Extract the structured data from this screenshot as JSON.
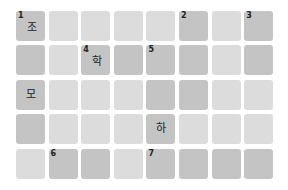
{
  "puzzle": {
    "type": "crossword",
    "rows": 5,
    "cols": 8,
    "colors": {
      "dark": "#c4c4c4",
      "light": "#dcdcdc"
    },
    "cells": [
      [
        {
          "shade": "dark",
          "num": "1",
          "ch": "조"
        },
        {
          "shade": "light",
          "num": "",
          "ch": ""
        },
        {
          "shade": "light",
          "num": "",
          "ch": ""
        },
        {
          "shade": "light",
          "num": "",
          "ch": ""
        },
        {
          "shade": "light",
          "num": "",
          "ch": ""
        },
        {
          "shade": "dark",
          "num": "2",
          "ch": ""
        },
        {
          "shade": "light",
          "num": "",
          "ch": ""
        },
        {
          "shade": "dark",
          "num": "3",
          "ch": ""
        }
      ],
      [
        {
          "shade": "dark",
          "num": "",
          "ch": ""
        },
        {
          "shade": "light",
          "num": "",
          "ch": ""
        },
        {
          "shade": "dark",
          "num": "4",
          "ch": "학"
        },
        {
          "shade": "dark",
          "num": "",
          "ch": ""
        },
        {
          "shade": "dark",
          "num": "5",
          "ch": ""
        },
        {
          "shade": "dark",
          "num": "",
          "ch": ""
        },
        {
          "shade": "light",
          "num": "",
          "ch": ""
        },
        {
          "shade": "dark",
          "num": "",
          "ch": ""
        }
      ],
      [
        {
          "shade": "dark",
          "num": "",
          "ch": "모"
        },
        {
          "shade": "light",
          "num": "",
          "ch": ""
        },
        {
          "shade": "light",
          "num": "",
          "ch": ""
        },
        {
          "shade": "light",
          "num": "",
          "ch": ""
        },
        {
          "shade": "dark",
          "num": "",
          "ch": ""
        },
        {
          "shade": "dark",
          "num": "",
          "ch": ""
        },
        {
          "shade": "light",
          "num": "",
          "ch": ""
        },
        {
          "shade": "light",
          "num": "",
          "ch": ""
        }
      ],
      [
        {
          "shade": "dark",
          "num": "",
          "ch": ""
        },
        {
          "shade": "light",
          "num": "",
          "ch": ""
        },
        {
          "shade": "light",
          "num": "",
          "ch": ""
        },
        {
          "shade": "light",
          "num": "",
          "ch": ""
        },
        {
          "shade": "dark",
          "num": "",
          "ch": "하"
        },
        {
          "shade": "light",
          "num": "",
          "ch": ""
        },
        {
          "shade": "light",
          "num": "",
          "ch": ""
        },
        {
          "shade": "light",
          "num": "",
          "ch": ""
        }
      ],
      [
        {
          "shade": "light",
          "num": "",
          "ch": ""
        },
        {
          "shade": "dark",
          "num": "6",
          "ch": ""
        },
        {
          "shade": "dark",
          "num": "",
          "ch": ""
        },
        {
          "shade": "light",
          "num": "",
          "ch": ""
        },
        {
          "shade": "dark",
          "num": "7",
          "ch": ""
        },
        {
          "shade": "dark",
          "num": "",
          "ch": ""
        },
        {
          "shade": "dark",
          "num": "",
          "ch": ""
        },
        {
          "shade": "dark",
          "num": "",
          "ch": ""
        }
      ]
    ]
  }
}
